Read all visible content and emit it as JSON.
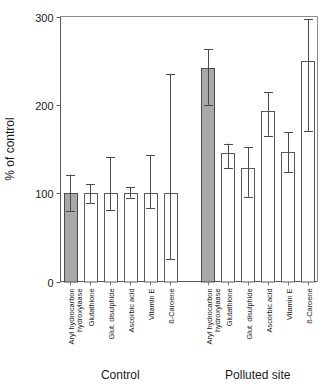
{
  "chart_data": {
    "type": "bar",
    "title": "",
    "xlabel": "",
    "ylabel": "% of control",
    "ylim": [
      0,
      300
    ],
    "yticks": [
      0,
      100,
      200,
      300
    ],
    "ytick_labels": [
      "0",
      "100",
      "200",
      "300"
    ],
    "grid": false,
    "legend": null,
    "groups": [
      "Control",
      "Polluted site"
    ],
    "categories": [
      "Aryl hydrocarbon hydroxylaase",
      "Glutathione",
      "Glut. disulphide",
      "Ascorbic acid",
      "Vitamin E",
      "ß-Caroene"
    ],
    "category_lines": [
      [
        "Aryl hydrocarbon",
        "hydroxylaase"
      ],
      [
        "Glutathione"
      ],
      [
        "Glut. disulphide"
      ],
      [
        "Ascorbic acid"
      ],
      [
        "Vitamin E"
      ],
      [
        "ß-Caroene"
      ]
    ],
    "series": [
      {
        "name": "Control",
        "values": [
          100,
          100,
          100,
          100,
          100,
          100
        ],
        "err_low": [
          80,
          89,
          81,
          95,
          83,
          25
        ],
        "err_high": [
          121,
          110,
          141,
          107,
          143,
          235
        ],
        "fill": [
          "solid",
          "open",
          "open",
          "open",
          "open",
          "open"
        ]
      },
      {
        "name": "Polluted site",
        "values": [
          242,
          145,
          128,
          193,
          147,
          250
        ],
        "err_low": [
          200,
          128,
          96,
          165,
          124,
          170
        ],
        "err_high": [
          263,
          156,
          152,
          214,
          169,
          297
        ],
        "fill": [
          "solid",
          "open",
          "open",
          "open",
          "open",
          "open"
        ]
      }
    ],
    "colors": {
      "bar_filled": "#a8a8a8",
      "bar_open": "#ffffff",
      "bar_edge": "#4a4a4a",
      "axis": "#5a5a5a",
      "text": "#1a1a1a"
    }
  }
}
